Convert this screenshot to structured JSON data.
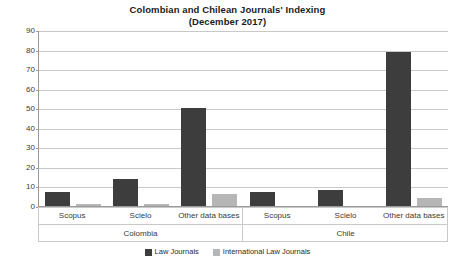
{
  "chart_data": {
    "type": "bar",
    "title": "Colombian and Chilean Journals' Indexing",
    "subtitle": "(December 2017)",
    "xlabel": "",
    "ylabel": "",
    "ylim": [
      0,
      90
    ],
    "ytick_step": 10,
    "yticks": [
      90,
      80,
      70,
      60,
      50,
      40,
      30,
      20,
      10,
      0
    ],
    "grid": true,
    "legend_position": "bottom",
    "categories": [
      "Scopus",
      "Scielo",
      "Other data bases",
      "Scopus",
      "Scielo",
      "Other data bases"
    ],
    "groups": [
      {
        "label": "Colombia",
        "span": 3
      },
      {
        "label": "Chile",
        "span": 3
      }
    ],
    "series": [
      {
        "name": "Law Journals",
        "color": "#3d3d3d",
        "values": [
          7,
          14,
          50,
          7,
          8,
          79
        ]
      },
      {
        "name": "International Law Journals",
        "color": "#b6b6b6",
        "values": [
          1,
          1,
          6,
          0,
          0,
          4
        ]
      }
    ]
  },
  "legend": {
    "items": [
      {
        "label": "Law Journals"
      },
      {
        "label": "International Law Journals"
      }
    ]
  }
}
